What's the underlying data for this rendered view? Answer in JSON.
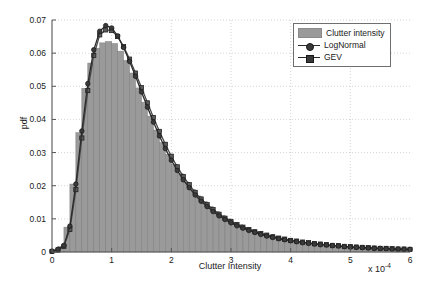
{
  "chart_data": {
    "type": "bar",
    "title": "",
    "xlabel": "Clutter Intensity",
    "ylabel": "pdf",
    "x_exponent_label": "x 10",
    "x_exponent_power": "-4",
    "xlim": [
      0,
      6
    ],
    "ylim": [
      0,
      0.07
    ],
    "xticks": [
      0,
      1,
      2,
      3,
      4,
      5,
      6
    ],
    "xtick_labels": [
      "0",
      "1",
      "2",
      "3",
      "4",
      "5",
      "6"
    ],
    "yticks": [
      0,
      0.01,
      0.02,
      0.03,
      0.04,
      0.05,
      0.06,
      0.07
    ],
    "ytick_labels": [
      "0",
      "0.01",
      "0.02",
      "0.03",
      "0.04",
      "0.05",
      "0.06",
      "0.07"
    ],
    "grid": true,
    "grid_style": "dotted",
    "legend_position": "upper right",
    "legend_entries": [
      "Clutter intensity",
      "LogNormal",
      "GEV"
    ],
    "colors": {
      "histogram_fill": "#9a9a9a",
      "histogram_edge": "#7d7d7d",
      "lognormal_line": "#2b2b2b",
      "lognormal_marker": "#3a3a3a",
      "gev_line": "#4a4a4a",
      "gev_marker": "#5a5a5a",
      "grid": "#c9c9c9",
      "axis": "#555555",
      "background": "#ffffff"
    },
    "histogram": {
      "name": "Clutter intensity",
      "bin_width": 0.1,
      "bin_centers": [
        0.05,
        0.15,
        0.25,
        0.35,
        0.45,
        0.55,
        0.65,
        0.75,
        0.85,
        0.95,
        1.05,
        1.15,
        1.25,
        1.35,
        1.45,
        1.55,
        1.65,
        1.75,
        1.85,
        1.95,
        2.05,
        2.15,
        2.25,
        2.35,
        2.45,
        2.55,
        2.65,
        2.75,
        2.85,
        2.95,
        3.05,
        3.15,
        3.25,
        3.35,
        3.45,
        3.55,
        3.65,
        3.75,
        3.85,
        3.95,
        4.05,
        4.15,
        4.25,
        4.35,
        4.45,
        4.55,
        4.65,
        4.75,
        4.85,
        4.95,
        5.05,
        5.15,
        5.25,
        5.35,
        5.45,
        5.55,
        5.65,
        5.75,
        5.85,
        5.95
      ],
      "values": [
        0.0004,
        0.0016,
        0.0075,
        0.0205,
        0.036,
        0.0494,
        0.057,
        0.0615,
        0.0631,
        0.0635,
        0.0629,
        0.0606,
        0.0578,
        0.054,
        0.0495,
        0.0452,
        0.041,
        0.0368,
        0.033,
        0.0295,
        0.0264,
        0.0236,
        0.0211,
        0.0189,
        0.0169,
        0.0152,
        0.0137,
        0.0123,
        0.0111,
        0.01,
        0.009,
        0.0082,
        0.0074,
        0.0067,
        0.0061,
        0.0055,
        0.005,
        0.0046,
        0.0042,
        0.0038,
        0.0035,
        0.0032,
        0.0029,
        0.0027,
        0.0025,
        0.0023,
        0.0021,
        0.0019,
        0.0018,
        0.0016,
        0.0015,
        0.0014,
        0.0013,
        0.0012,
        0.0011,
        0.001,
        0.001,
        0.0009,
        0.0008,
        0.0008
      ]
    },
    "series": [
      {
        "name": "LogNormal",
        "marker": "circle",
        "x": [
          0.0,
          0.1,
          0.2,
          0.3,
          0.4,
          0.5,
          0.6,
          0.7,
          0.8,
          0.9,
          1.0,
          1.1,
          1.2,
          1.3,
          1.4,
          1.5,
          1.6,
          1.7,
          1.8,
          1.9,
          2.0,
          2.1,
          2.2,
          2.3,
          2.4,
          2.5,
          2.6,
          2.7,
          2.8,
          2.9,
          3.0,
          3.1,
          3.2,
          3.3,
          3.4,
          3.5,
          3.6,
          3.7,
          3.8,
          3.9,
          4.0,
          4.1,
          4.2,
          4.3,
          4.4,
          4.5,
          4.6,
          4.7,
          4.8,
          4.9,
          5.0,
          5.1,
          5.2,
          5.3,
          5.4,
          5.5,
          5.6,
          5.7,
          5.8,
          5.9,
          6.0
        ],
        "y": [
          0.0002,
          0.0008,
          0.002,
          0.0078,
          0.0205,
          0.0365,
          0.0508,
          0.061,
          0.0666,
          0.0683,
          0.0676,
          0.0652,
          0.0617,
          0.0575,
          0.053,
          0.0483,
          0.0437,
          0.0392,
          0.035,
          0.0312,
          0.0277,
          0.0246,
          0.0218,
          0.0194,
          0.0172,
          0.0153,
          0.0137,
          0.0122,
          0.0109,
          0.0098,
          0.0088,
          0.0079,
          0.0072,
          0.0065,
          0.0059,
          0.0053,
          0.0048,
          0.0044,
          0.004,
          0.0037,
          0.0034,
          0.0031,
          0.0028,
          0.0026,
          0.0024,
          0.0022,
          0.0021,
          0.0019,
          0.0018,
          0.0016,
          0.0015,
          0.0014,
          0.0013,
          0.0012,
          0.0011,
          0.0011,
          0.001,
          0.0009,
          0.0009,
          0.0008,
          0.0008
        ]
      },
      {
        "name": "GEV",
        "marker": "square",
        "x": [
          0.0,
          0.1,
          0.2,
          0.3,
          0.4,
          0.5,
          0.6,
          0.7,
          0.8,
          0.9,
          1.0,
          1.1,
          1.2,
          1.3,
          1.4,
          1.5,
          1.6,
          1.7,
          1.8,
          1.9,
          2.0,
          2.1,
          2.2,
          2.3,
          2.4,
          2.5,
          2.6,
          2.7,
          2.8,
          2.9,
          3.0,
          3.1,
          3.2,
          3.3,
          3.4,
          3.5,
          3.6,
          3.7,
          3.8,
          3.9,
          4.0,
          4.1,
          4.2,
          4.3,
          4.4,
          4.5,
          4.6,
          4.7,
          4.8,
          4.9,
          5.0,
          5.1,
          5.2,
          5.3,
          5.4,
          5.5,
          5.6,
          5.7,
          5.8,
          5.9,
          6.0
        ],
        "y": [
          0.0002,
          0.0006,
          0.0017,
          0.0068,
          0.0188,
          0.0344,
          0.0487,
          0.0593,
          0.0655,
          0.067,
          0.0668,
          0.065,
          0.062,
          0.0582,
          0.054,
          0.0496,
          0.045,
          0.0406,
          0.0364,
          0.0325,
          0.0289,
          0.0257,
          0.0228,
          0.0203,
          0.018,
          0.016,
          0.0143,
          0.0128,
          0.0114,
          0.0102,
          0.0092,
          0.0083,
          0.0075,
          0.0068,
          0.0061,
          0.0056,
          0.0051,
          0.0046,
          0.0042,
          0.0039,
          0.0035,
          0.0033,
          0.003,
          0.0028,
          0.0025,
          0.0024,
          0.0022,
          0.002,
          0.0019,
          0.0017,
          0.0016,
          0.0015,
          0.0014,
          0.0013,
          0.0012,
          0.0011,
          0.0011,
          0.001,
          0.0009,
          0.0009,
          0.0008
        ]
      }
    ]
  }
}
